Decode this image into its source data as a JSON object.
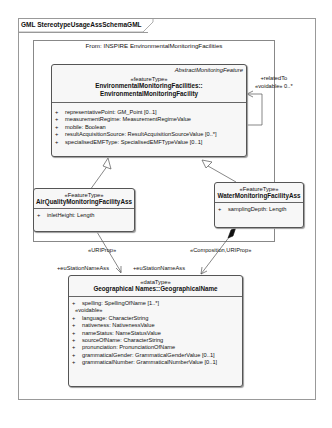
{
  "frame": {
    "title": "GML StereotypeUsageAssSchemaGML"
  },
  "package": {
    "title": "From: INSPIRE EnvironmentalMonitoringFacilities"
  },
  "classes": {
    "emf": {
      "abstract_label": "AbstractMonitoringFeature",
      "stereotype": "«featureType»",
      "name_line1": "EnvironmentalMonitoringFacilities::",
      "name_line2": "EnvironmentalMonitoringFacility",
      "attributes": [
        {
          "vis": "+",
          "text": "representativePoint: GM_Point [0..1]"
        },
        {
          "vis": "+",
          "text": "measurementRegime: MeasurementRegimeValue"
        },
        {
          "vis": "+",
          "text": "mobile: Boolean"
        },
        {
          "vis": "+",
          "text": "resultAcquisitionSource: ResultAcquisitionSourceValue [0..*]"
        },
        {
          "vis": "+",
          "text": "specialisedEMFType: SpecialisedEMFTypeValue [0..1]"
        }
      ]
    },
    "air": {
      "stereotype": "«FeatureType»",
      "name": "AirQualityMonitoringFacilityAss",
      "attributes": [
        {
          "vis": "+",
          "text": "inletHeight: Length"
        }
      ]
    },
    "water": {
      "stereotype": "«FeatureType»",
      "name": "WaterMonitoringFacilityAss",
      "attributes": [
        {
          "vis": "+",
          "text": "samplingDepth: Length"
        }
      ]
    },
    "geo": {
      "stereotype": "«dataType»",
      "name": "Geographical Names::GeographicalName",
      "attributes": [
        {
          "vis": "+",
          "text": "spelling: SpellingOfName [1..*]"
        }
      ],
      "voidable_label": "«voidable»",
      "voidable_attributes": [
        {
          "vis": "+",
          "text": "language: CharacterString"
        },
        {
          "vis": "+",
          "text": "nativeness: NativenessValue"
        },
        {
          "vis": "+",
          "text": "nameStatus: NameStatusValue"
        },
        {
          "vis": "+",
          "text": "sourceOfName: CharacterString"
        },
        {
          "vis": "+",
          "text": "pronunciation: PronunciationOfName"
        },
        {
          "vis": "+",
          "text": "grammaticalGender: GrammaticalGenderValue [0..1]"
        },
        {
          "vis": "+",
          "text": "grammaticalNumber: GrammaticalNumberValue [0..1]"
        }
      ]
    }
  },
  "associations": {
    "self": {
      "line1": "+relatedTo",
      "line2": "«voidable» 0..*"
    },
    "air_geo": {
      "stereotype": "«URIProp»",
      "role": "+euStationNameAss"
    },
    "water_geo": {
      "stereotype": "«Composition,URIProp»",
      "role": "+euStationNameAss"
    }
  }
}
